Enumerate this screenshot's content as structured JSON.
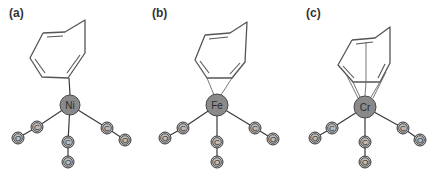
{
  "figure": {
    "panels": [
      {
        "label": "(a)",
        "metal": "Ni",
        "ligands": [
          {
            "c": "C",
            "o": "O"
          },
          {
            "c": "C",
            "o": "O"
          },
          {
            "c": "C",
            "o": "O"
          }
        ]
      },
      {
        "label": "(b)",
        "metal": "Fe",
        "ligands": [
          {
            "c": "C",
            "o": "O"
          },
          {
            "c": "C",
            "o": "O"
          },
          {
            "c": "C",
            "o": "O"
          }
        ]
      },
      {
        "label": "(c)",
        "metal": "Cr",
        "ligands": [
          {
            "c": "C",
            "o": "O"
          },
          {
            "c": "C",
            "o": "O"
          },
          {
            "c": "C",
            "o": "O"
          }
        ]
      }
    ]
  },
  "colors": {
    "metal_fill": "#8a8a8a",
    "atom_fill": "#bdbdbd",
    "bond": "#3a3a3a"
  }
}
